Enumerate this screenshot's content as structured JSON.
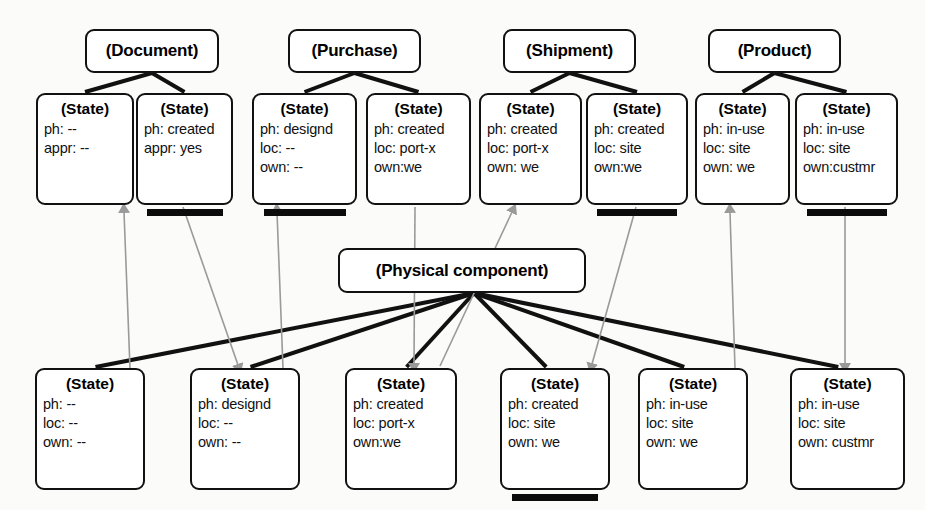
{
  "diagram": {
    "colors": {
      "background": "#fbfbfa",
      "node_border": "#111111",
      "node_fill": "#ffffff",
      "solid_edge": "#111111",
      "gray_edge": "#9a9a9a",
      "underline_bar": "#0c0c0c"
    }
  },
  "classes": [
    {
      "id": "document",
      "label": "(Document)",
      "x": 85,
      "y": 29,
      "w": 134,
      "h": 44
    },
    {
      "id": "purchase",
      "label": "(Purchase)",
      "x": 288,
      "y": 29,
      "w": 133,
      "h": 44
    },
    {
      "id": "shipment",
      "label": "(Shipment)",
      "x": 503,
      "y": 29,
      "w": 133,
      "h": 44
    },
    {
      "id": "product",
      "label": "(Product)",
      "x": 708,
      "y": 29,
      "w": 133,
      "h": 44
    },
    {
      "id": "physical",
      "label": "(Physical component)",
      "x": 338,
      "y": 248,
      "w": 248,
      "h": 45
    }
  ],
  "top_states": [
    {
      "id": "t1",
      "title": "(State)",
      "x": 36,
      "y": 93,
      "w": 98,
      "h": 112,
      "attrs": [
        "ph: --",
        "appr: --"
      ],
      "underlined": false
    },
    {
      "id": "t2",
      "title": "(State)",
      "x": 136,
      "y": 93,
      "w": 97,
      "h": 112,
      "attrs": [
        "ph: created",
        "appr: yes"
      ],
      "underlined": true
    },
    {
      "id": "t3",
      "title": "(State)",
      "x": 252,
      "y": 93,
      "w": 105,
      "h": 112,
      "attrs": [
        "ph: designd",
        "loc: --",
        "own: --"
      ],
      "underlined": true
    },
    {
      "id": "t4",
      "title": "(State)",
      "x": 366,
      "y": 93,
      "w": 105,
      "h": 112,
      "attrs": [
        "ph: created",
        "loc: port-x",
        "own:we"
      ],
      "underlined": false
    },
    {
      "id": "t5",
      "title": "(State)",
      "x": 479,
      "y": 93,
      "w": 103,
      "h": 112,
      "attrs": [
        "ph: created",
        "loc: port-x",
        "own: we"
      ],
      "underlined": false
    },
    {
      "id": "t6",
      "title": "(State)",
      "x": 586,
      "y": 93,
      "w": 102,
      "h": 112,
      "attrs": [
        "ph: created",
        "loc: site",
        "own:we"
      ],
      "underlined": true
    },
    {
      "id": "t7",
      "title": "(State)",
      "x": 695,
      "y": 93,
      "w": 95,
      "h": 112,
      "attrs": [
        "ph: in-use",
        "loc: site",
        "own: we"
      ],
      "underlined": false
    },
    {
      "id": "t8",
      "title": "(State)",
      "x": 795,
      "y": 93,
      "w": 103,
      "h": 112,
      "attrs": [
        "ph: in-use",
        "loc: site",
        "own:custmr"
      ],
      "underlined": true
    }
  ],
  "bottom_states": [
    {
      "id": "b1",
      "title": "(State)",
      "x": 35,
      "y": 368,
      "w": 110,
      "h": 122,
      "attrs": [
        "ph: --",
        "loc: --",
        "own: --"
      ],
      "underlined": false
    },
    {
      "id": "b2",
      "title": "(State)",
      "x": 190,
      "y": 368,
      "w": 110,
      "h": 122,
      "attrs": [
        "ph: designd",
        "loc: --",
        "own: --"
      ],
      "underlined": false
    },
    {
      "id": "b3",
      "title": "(State)",
      "x": 345,
      "y": 368,
      "w": 112,
      "h": 122,
      "attrs": [
        "ph: created",
        "loc: port-x",
        "own:we"
      ],
      "underlined": false
    },
    {
      "id": "b4",
      "title": "(State)",
      "x": 500,
      "y": 368,
      "w": 110,
      "h": 122,
      "attrs": [
        "ph: created",
        "loc: site",
        "own: we"
      ],
      "underlined": true
    },
    {
      "id": "b5",
      "title": "(State)",
      "x": 638,
      "y": 368,
      "w": 110,
      "h": 122,
      "attrs": [
        "ph: in-use",
        "loc: site",
        "own: we"
      ],
      "underlined": false
    },
    {
      "id": "b6",
      "title": "(State)",
      "x": 790,
      "y": 368,
      "w": 115,
      "h": 122,
      "attrs": [
        "ph: in-use",
        "loc: site",
        "own: custmr"
      ],
      "underlined": false
    }
  ],
  "edges": {
    "class_to_state": [
      {
        "from": "document",
        "to": "t1"
      },
      {
        "from": "document",
        "to": "t2"
      },
      {
        "from": "purchase",
        "to": "t3"
      },
      {
        "from": "purchase",
        "to": "t4"
      },
      {
        "from": "shipment",
        "to": "t5"
      },
      {
        "from": "shipment",
        "to": "t6"
      },
      {
        "from": "product",
        "to": "t7"
      },
      {
        "from": "product",
        "to": "t8"
      }
    ],
    "physical_to_state": [
      {
        "from": "physical",
        "to": "b1"
      },
      {
        "from": "physical",
        "to": "b2"
      },
      {
        "from": "physical",
        "to": "b3"
      },
      {
        "from": "physical",
        "to": "b4"
      },
      {
        "from": "physical",
        "to": "b5"
      },
      {
        "from": "physical",
        "to": "b6"
      }
    ],
    "gray_arrows": [
      {
        "from": "b1",
        "to": "t1",
        "direction": "up"
      },
      {
        "from": "t2",
        "to": "b2",
        "direction": "down"
      },
      {
        "from": "b2",
        "to": "t3",
        "direction": "up"
      },
      {
        "from": "t4",
        "to": "b3",
        "direction": "down"
      },
      {
        "from": "b3",
        "to": "t5",
        "direction": "up"
      },
      {
        "from": "t6",
        "to": "b4",
        "direction": "down"
      },
      {
        "from": "b5",
        "to": "t7",
        "direction": "up"
      },
      {
        "from": "t8",
        "to": "b6",
        "direction": "down"
      }
    ]
  }
}
